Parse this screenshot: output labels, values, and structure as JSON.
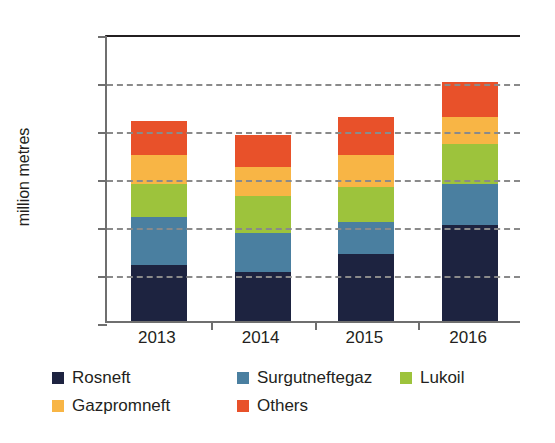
{
  "chart_data": {
    "type": "bar",
    "stacked": true,
    "title": "",
    "xlabel": "",
    "ylabel": "million metres",
    "categories": [
      "2013",
      "2014",
      "2015",
      "2016"
    ],
    "ylim": [
      0,
      30
    ],
    "yticks": [
      0,
      5,
      10,
      15,
      20,
      25,
      30
    ],
    "grid": true,
    "legend_position": "bottom",
    "series": [
      {
        "name": "Rosneft",
        "color": "#1d2340",
        "values": [
          5.8,
          5.1,
          7.0,
          10.0
        ]
      },
      {
        "name": "Surgutneftegaz",
        "color": "#4a7fa0",
        "values": [
          5.0,
          4.1,
          3.3,
          4.3
        ]
      },
      {
        "name": "Lukoil",
        "color": "#9dc33c",
        "values": [
          3.5,
          3.8,
          3.7,
          4.1
        ]
      },
      {
        "name": "Gazpromneft",
        "color": "#f8b545",
        "values": [
          3.0,
          3.0,
          3.3,
          2.9
        ]
      },
      {
        "name": "Others",
        "color": "#e8512a",
        "values": [
          3.5,
          3.4,
          4.0,
          3.6
        ]
      }
    ],
    "totals": [
      20.8,
      19.4,
      21.3,
      24.9
    ]
  },
  "axis": {
    "y_label": "million metres"
  }
}
